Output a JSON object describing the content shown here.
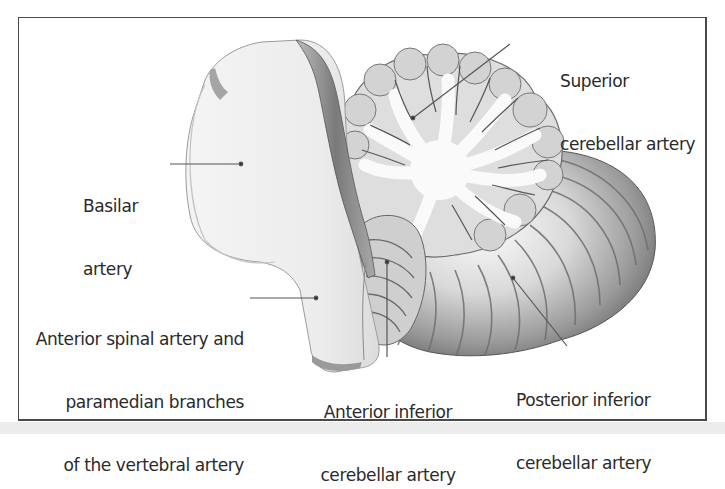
{
  "figure": {
    "colors": {
      "frame": "#4a4a4a",
      "label_text": "#2a2a2a",
      "leader_line": "#555555",
      "brainstem": "#f1f1f1",
      "cerebellum_white_matter": "#f7f7f7",
      "cerebellum_folia": "#b5b5b5",
      "background_strip": "#ececec"
    }
  },
  "labels": {
    "superior": {
      "line1": "Superior",
      "line2": "cerebellar artery"
    },
    "basilar": {
      "line1": "Basilar",
      "line2": "artery"
    },
    "anterior_spinal": {
      "line1": "Anterior spinal artery and",
      "line2": "paramedian branches",
      "line3": "of the vertebral artery"
    },
    "aica": {
      "line1": "Anterior inferior",
      "line2": "cerebellar artery"
    },
    "pica": {
      "line1": "Posterior inferior",
      "line2": "cerebellar artery"
    }
  }
}
